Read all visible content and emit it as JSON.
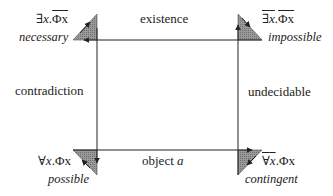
{
  "corners": {
    "top_left": {
      "formula_quant": "∃",
      "formula_var": "x",
      "formula_sep": ".",
      "formula_pred": "Φx",
      "overline": "predicate",
      "modality": "necessary"
    },
    "top_right": {
      "formula_quant": "∃",
      "formula_var": "x",
      "formula_sep": ".",
      "formula_pred": "Φx",
      "overline": "both",
      "modality": "impossible"
    },
    "bottom_left": {
      "formula_quant": "∀",
      "formula_var": "x",
      "formula_sep": ".",
      "formula_pred": "Φx",
      "overline": "none",
      "modality": "possible"
    },
    "bottom_right": {
      "formula_quant": "∀",
      "formula_var": "x",
      "formula_sep": ".",
      "formula_pred": "Φx",
      "overline": "quantifier",
      "modality": "contingent"
    }
  },
  "edges": {
    "top": "existence",
    "left": "contradiction",
    "right": "undecidable",
    "bottom_prefix": "object ",
    "bottom_var": "a"
  },
  "colors": {
    "line": "#222222",
    "triangle_fill": "#8a8a8a",
    "text": "#222222"
  }
}
